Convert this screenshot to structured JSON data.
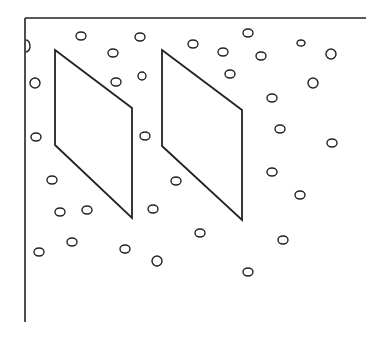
{
  "diagram": {
    "stroke_color": "#222222",
    "background": "#ffffff",
    "frame": {
      "left_line": {
        "x": 25,
        "y1": 18,
        "y2": 322
      },
      "top_line": {
        "y": 18,
        "x1": 25,
        "x2": 366
      }
    },
    "parallelograms": [
      {
        "name": "left-panel",
        "points": "55,50 132,108 132,218 55,145"
      },
      {
        "name": "right-panel",
        "points": "162,50 242,110 242,220 162,146"
      }
    ],
    "circles": [
      {
        "cx": 81,
        "cy": 36,
        "rx": 5,
        "ry": 4
      },
      {
        "cx": 113,
        "cy": 53,
        "rx": 5,
        "ry": 4
      },
      {
        "cx": 140,
        "cy": 37,
        "rx": 5,
        "ry": 4
      },
      {
        "cx": 142,
        "cy": 76,
        "rx": 4,
        "ry": 4
      },
      {
        "cx": 116,
        "cy": 82,
        "rx": 5,
        "ry": 4
      },
      {
        "cx": 35,
        "cy": 83,
        "rx": 5,
        "ry": 5
      },
      {
        "cx": 36,
        "cy": 137,
        "rx": 5,
        "ry": 4
      },
      {
        "cx": 145,
        "cy": 136,
        "rx": 5,
        "ry": 4
      },
      {
        "cx": 193,
        "cy": 44,
        "rx": 5,
        "ry": 4
      },
      {
        "cx": 223,
        "cy": 52,
        "rx": 5,
        "ry": 4
      },
      {
        "cx": 248,
        "cy": 33,
        "rx": 5,
        "ry": 4
      },
      {
        "cx": 261,
        "cy": 56,
        "rx": 5,
        "ry": 4
      },
      {
        "cx": 230,
        "cy": 74,
        "rx": 5,
        "ry": 4
      },
      {
        "cx": 301,
        "cy": 43,
        "rx": 4,
        "ry": 3
      },
      {
        "cx": 331,
        "cy": 54,
        "rx": 5,
        "ry": 5
      },
      {
        "cx": 313,
        "cy": 83,
        "rx": 5,
        "ry": 5
      },
      {
        "cx": 272,
        "cy": 98,
        "rx": 5,
        "ry": 4
      },
      {
        "cx": 280,
        "cy": 129,
        "rx": 5,
        "ry": 4
      },
      {
        "cx": 332,
        "cy": 143,
        "rx": 5,
        "ry": 4
      },
      {
        "cx": 272,
        "cy": 172,
        "rx": 5,
        "ry": 4
      },
      {
        "cx": 300,
        "cy": 195,
        "rx": 5,
        "ry": 4
      },
      {
        "cx": 283,
        "cy": 240,
        "rx": 5,
        "ry": 4
      },
      {
        "cx": 248,
        "cy": 272,
        "rx": 5,
        "ry": 4
      },
      {
        "cx": 200,
        "cy": 233,
        "rx": 5,
        "ry": 4
      },
      {
        "cx": 176,
        "cy": 181,
        "rx": 5,
        "ry": 4
      },
      {
        "cx": 153,
        "cy": 209,
        "rx": 5,
        "ry": 4
      },
      {
        "cx": 157,
        "cy": 261,
        "rx": 5,
        "ry": 5
      },
      {
        "cx": 125,
        "cy": 249,
        "rx": 5,
        "ry": 4
      },
      {
        "cx": 177,
        "cy": 182,
        "rx": 0,
        "ry": 0
      },
      {
        "cx": 52,
        "cy": 180,
        "rx": 5,
        "ry": 4
      },
      {
        "cx": 60,
        "cy": 212,
        "rx": 5,
        "ry": 4
      },
      {
        "cx": 87,
        "cy": 210,
        "rx": 5,
        "ry": 4
      },
      {
        "cx": 72,
        "cy": 242,
        "rx": 5,
        "ry": 4
      },
      {
        "cx": 39,
        "cy": 252,
        "rx": 5,
        "ry": 4
      }
    ],
    "edge_arc": {
      "cx": 26,
      "cy": 46,
      "rx": 4,
      "ry": 6
    }
  }
}
